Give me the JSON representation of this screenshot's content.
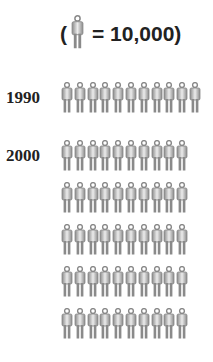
{
  "legend": {
    "open": "(",
    "equals": "= 10,000)",
    "icon": "person-icon",
    "unit_value": 10000
  },
  "rows": [
    {
      "year": "1990",
      "lines": [
        11
      ]
    },
    {
      "year": "2000",
      "lines": [
        10,
        10,
        10,
        10,
        10
      ]
    }
  ],
  "colors": {
    "figure": "#8c8c8c",
    "figure_light": "#e8e8e8",
    "text": "#222222"
  },
  "chart_data": {
    "type": "pictograph",
    "title": "",
    "unit": "1 person icon = 10,000",
    "categories": [
      "1990",
      "2000"
    ],
    "icon_counts": [
      11,
      50
    ],
    "values": [
      110000,
      500000
    ],
    "layout": {
      "1990": "1 row of 11 icons",
      "2000": "5 rows of 10 icons"
    }
  }
}
